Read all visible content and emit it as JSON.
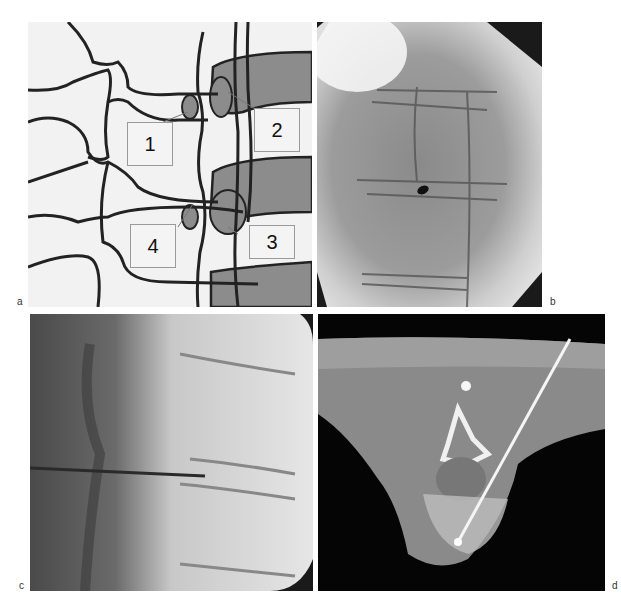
{
  "figure": {
    "panels": [
      {
        "id": "a",
        "label": "a",
        "kind": "schematic drawing of spine (oblique view)",
        "callouts": [
          {
            "label": "1"
          },
          {
            "label": "2"
          },
          {
            "label": "3"
          },
          {
            "label": "4"
          }
        ]
      },
      {
        "id": "b",
        "label": "b",
        "kind": "fluoroscopy image, oblique view"
      },
      {
        "id": "c",
        "label": "c",
        "kind": "fluoroscopy image, lateral view with needle"
      },
      {
        "id": "d",
        "label": "d",
        "kind": "axial CT image with needle"
      }
    ]
  },
  "colors": {
    "schematic_fill": "#f2f2f2",
    "schematic_line": "#222222",
    "schematic_gray": "#8c8c8c",
    "xray_dark": "#1a1a1a",
    "ct_soft_tissue": "#8a8a8a"
  }
}
